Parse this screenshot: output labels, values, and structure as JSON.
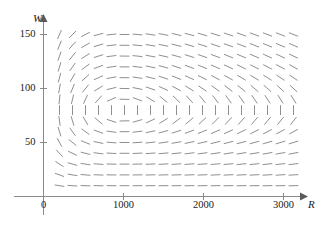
{
  "figure": {
    "top_cut_text": "———   ———,",
    "axes": {
      "x": {
        "label": "R",
        "min": 0,
        "max": 3250,
        "ticks": [
          {
            "value": 0,
            "label": "0"
          },
          {
            "value": 1000,
            "label": "1000"
          },
          {
            "value": 2000,
            "label": "2000"
          },
          {
            "value": 3000,
            "label": "3000"
          }
        ]
      },
      "y": {
        "label": "W",
        "min": 0,
        "max": 165,
        "ticks": [
          {
            "value": 50,
            "label": "50"
          },
          {
            "value": 100,
            "label": "100"
          },
          {
            "value": 150,
            "label": "150"
          }
        ]
      }
    }
  },
  "chart_data": {
    "type": "scatter",
    "plot_kind": "direction-field",
    "title": "",
    "subtitle": "",
    "xlabel": "R",
    "ylabel": "W",
    "xlim": [
      0,
      3250
    ],
    "ylim": [
      0,
      165
    ],
    "xticks": [
      0,
      1000,
      2000,
      3000
    ],
    "yticks": [
      50,
      100,
      150
    ],
    "grid": false,
    "legend": null,
    "annotations": [],
    "stroke_color": "#8f8f8f",
    "axis_color": "#8a8a8a",
    "text_color": "#1a1a1a",
    "system": {
      "name": "Lotka-Volterra predator-prey",
      "dR_dt": "0.08*R - 0.001*R*W",
      "dW_dt": "-0.02*W + 0.00002*R*W",
      "equilibrium": [
        1000,
        80
      ],
      "rotation": "counterclockwise"
    },
    "field_grid": {
      "x_start": 200,
      "x_step": 162.5,
      "x_count": 19,
      "y_start": 10,
      "y_step": 10,
      "y_count": 15,
      "segment_length_px": 9
    }
  }
}
